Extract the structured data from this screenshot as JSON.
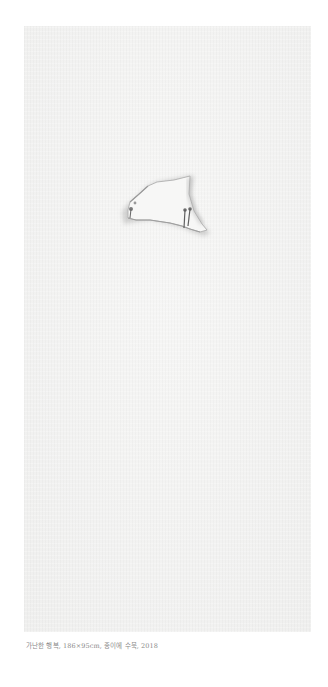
{
  "artwork": {
    "subject": "torn paper fragment pinned with two nails on blank hanji paper",
    "colors": {
      "paper": "#f3f3f2",
      "tear_shadow": "#9a9a9a",
      "nail": "#6b6b6b"
    }
  },
  "caption": {
    "text": "가난한 행복, 186×95cm, 종이에 수묵, 2018",
    "title": "가난한 행복",
    "dimensions": "186×95cm",
    "medium": "종이에 수묵",
    "year": "2018"
  }
}
